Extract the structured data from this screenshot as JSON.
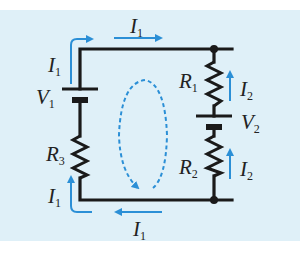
{
  "diagram": {
    "type": "circuit",
    "background_color": "#dff0f8",
    "wire_color": "#1a1a1a",
    "arrow_color": "#2b8fd6",
    "labels": {
      "I1_top": {
        "main": "I",
        "sub": "1"
      },
      "I1_left_top": {
        "main": "I",
        "sub": "1"
      },
      "V1": {
        "main": "V",
        "sub": "1"
      },
      "R3": {
        "main": "R",
        "sub": "3"
      },
      "I1_left_bottom": {
        "main": "I",
        "sub": "1"
      },
      "I1_bottom": {
        "main": "I",
        "sub": "1"
      },
      "R1": {
        "main": "R",
        "sub": "1"
      },
      "I2_upper": {
        "main": "I",
        "sub": "2"
      },
      "V2": {
        "main": "V",
        "sub": "2"
      },
      "R2": {
        "main": "R",
        "sub": "2"
      },
      "I2_lower": {
        "main": "I",
        "sub": "2"
      }
    },
    "components": [
      {
        "id": "V1",
        "kind": "battery",
        "branch": "left"
      },
      {
        "id": "R3",
        "kind": "resistor",
        "branch": "left"
      },
      {
        "id": "R1",
        "kind": "resistor",
        "branch": "right"
      },
      {
        "id": "V2",
        "kind": "battery",
        "branch": "right"
      },
      {
        "id": "R2",
        "kind": "resistor",
        "branch": "right"
      }
    ],
    "loop_direction": "clockwise"
  }
}
